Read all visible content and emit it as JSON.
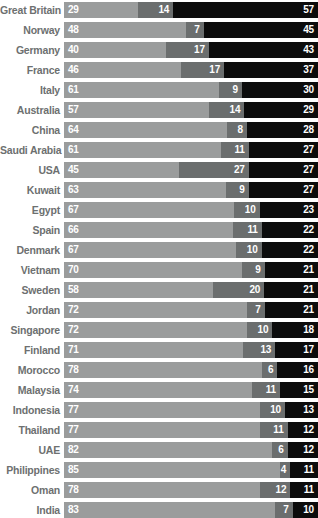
{
  "chart_data": {
    "type": "bar",
    "subtype": "stacked-horizontal-100pct",
    "title": "",
    "xlabel": "",
    "ylabel": "",
    "xlim": [
      0,
      100
    ],
    "grid": false,
    "legend_position": "none",
    "series": [
      {
        "name": "segment-1",
        "color": "#9a9c9c"
      },
      {
        "name": "segment-2",
        "color": "#6b6e6e"
      },
      {
        "name": "segment-3",
        "color": "#0c0c0c"
      }
    ],
    "categories": [
      "Great Britain",
      "Norway",
      "Germany",
      "France",
      "Italy",
      "Australia",
      "China",
      "Saudi Arabia",
      "USA",
      "Kuwait",
      "Egypt",
      "Spain",
      "Denmark",
      "Vietnam",
      "Sweden",
      "Jordan",
      "Singapore",
      "Finland",
      "Morocco",
      "Malaysia",
      "Indonesia",
      "Thailand",
      "UAE",
      "Philippines",
      "Oman",
      "India"
    ],
    "rows": [
      {
        "label": "Great Britain",
        "values": [
          29,
          14,
          57
        ]
      },
      {
        "label": "Norway",
        "values": [
          48,
          7,
          45
        ]
      },
      {
        "label": "Germany",
        "values": [
          40,
          17,
          43
        ]
      },
      {
        "label": "France",
        "values": [
          46,
          17,
          37
        ]
      },
      {
        "label": "Italy",
        "values": [
          61,
          9,
          30
        ]
      },
      {
        "label": "Australia",
        "values": [
          57,
          14,
          29
        ]
      },
      {
        "label": "China",
        "values": [
          64,
          8,
          28
        ]
      },
      {
        "label": "Saudi Arabia",
        "values": [
          61,
          11,
          27
        ]
      },
      {
        "label": "USA",
        "values": [
          45,
          27,
          27
        ]
      },
      {
        "label": "Kuwait",
        "values": [
          63,
          9,
          27
        ]
      },
      {
        "label": "Egypt",
        "values": [
          67,
          10,
          23
        ]
      },
      {
        "label": "Spain",
        "values": [
          66,
          11,
          22
        ]
      },
      {
        "label": "Denmark",
        "values": [
          67,
          10,
          22
        ]
      },
      {
        "label": "Vietnam",
        "values": [
          70,
          9,
          21
        ]
      },
      {
        "label": "Sweden",
        "values": [
          58,
          20,
          21
        ]
      },
      {
        "label": "Jordan",
        "values": [
          72,
          7,
          21
        ]
      },
      {
        "label": "Singapore",
        "values": [
          72,
          10,
          18
        ]
      },
      {
        "label": "Finland",
        "values": [
          71,
          13,
          17
        ]
      },
      {
        "label": "Morocco",
        "values": [
          78,
          6,
          16
        ]
      },
      {
        "label": "Malaysia",
        "values": [
          74,
          11,
          15
        ]
      },
      {
        "label": "Indonesia",
        "values": [
          77,
          10,
          13
        ]
      },
      {
        "label": "Thailand",
        "values": [
          77,
          11,
          12
        ]
      },
      {
        "label": "UAE",
        "values": [
          82,
          6,
          12
        ]
      },
      {
        "label": "Philippines",
        "values": [
          85,
          4,
          11
        ]
      },
      {
        "label": "Oman",
        "values": [
          78,
          12,
          11
        ]
      },
      {
        "label": "India",
        "values": [
          83,
          7,
          10
        ]
      }
    ]
  },
  "style": {
    "label_color": "#6d7070",
    "value_color": "#ffffff",
    "background": "#ffffff"
  }
}
